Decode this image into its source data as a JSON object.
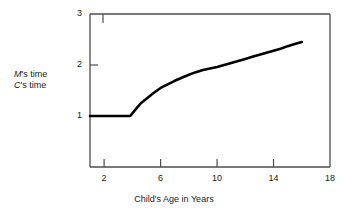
{
  "chart_data": {
    "type": "line",
    "title": "",
    "xlabel": "Child's Age in Years",
    "ylabel_numerator": "M's time",
    "ylabel_denominator": "C's time",
    "ylabel_numerator_italic_prefix": "M",
    "ylabel_denominator_italic_prefix": "C",
    "xlim": [
      1,
      18
    ],
    "ylim": [
      0,
      3
    ],
    "xticks": [
      2,
      6,
      10,
      14,
      18
    ],
    "yticks": [
      1,
      2,
      3
    ],
    "xtick_labels": [
      "2",
      "6",
      "10",
      "14",
      "18"
    ],
    "ytick_labels": [
      "1",
      "2",
      "3"
    ],
    "grid": false,
    "legend": "none",
    "line_color": "#000000",
    "axis_color": "#4d4d4d",
    "background": "#ffffff",
    "series": [
      {
        "name": "M's time / C's time",
        "x": [
          1.0,
          1.5,
          2.0,
          2.5,
          3.0,
          3.5,
          3.85,
          4.2,
          4.6,
          5.0,
          5.5,
          6.0,
          6.5,
          7.0,
          7.5,
          8.0,
          8.5,
          9.0,
          9.5,
          10.0,
          10.5,
          11.0,
          11.5,
          12.0,
          12.5,
          13.0,
          13.5,
          14.0,
          14.5,
          15.0,
          15.5,
          16.0
        ],
        "y": [
          1.0,
          1.0,
          1.0,
          1.0,
          1.0,
          1.0,
          1.0,
          1.12,
          1.25,
          1.34,
          1.45,
          1.55,
          1.62,
          1.69,
          1.75,
          1.81,
          1.86,
          1.9,
          1.93,
          1.96,
          2.0,
          2.04,
          2.08,
          2.12,
          2.16,
          2.2,
          2.24,
          2.28,
          2.32,
          2.37,
          2.41,
          2.45
        ]
      }
    ],
    "annotations": [
      {
        "text": "flat plateau at 1.0 until about age 3.9"
      },
      {
        "text": "concave-down rise to about 2.45 by age 16"
      }
    ]
  },
  "axis_geometry": {
    "plot_left": 90,
    "plot_right": 330,
    "plot_top": 14,
    "plot_bottom": 167
  }
}
